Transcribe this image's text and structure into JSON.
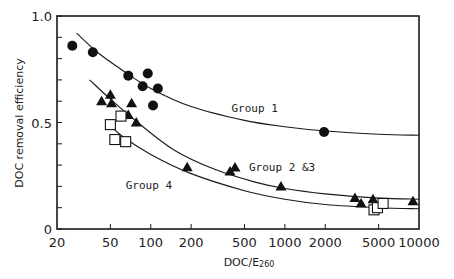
{
  "chart_data": {
    "type": "scatter",
    "title": "",
    "xlabel": "DOC/E",
    "xlabel_subscript": "260",
    "ylabel": "DOC removal efficiency",
    "xscale": "log",
    "xlim": [
      20,
      10000
    ],
    "ylim": [
      0,
      1.0
    ],
    "x_ticks": [
      20,
      50,
      100,
      200,
      500,
      1000,
      2000,
      5000,
      10000
    ],
    "x_tick_labels": [
      "20",
      "50",
      "100",
      "200",
      "500",
      "1000",
      "2000",
      "5000",
      "10000"
    ],
    "y_ticks": [
      0,
      0.5,
      1.0
    ],
    "y_tick_labels": [
      "0",
      "0.5",
      "1.0"
    ],
    "y_minor_step": 0.1,
    "grid": false,
    "legend": null,
    "series": [
      {
        "name": "Group 1",
        "marker": "filled-circle",
        "points": [
          [
            26,
            0.86
          ],
          [
            37,
            0.83
          ],
          [
            68,
            0.72
          ],
          [
            95,
            0.73
          ],
          [
            87,
            0.67
          ],
          [
            113,
            0.66
          ],
          [
            104,
            0.58
          ],
          [
            1960,
            0.455
          ]
        ]
      },
      {
        "name": "Group 2 &3",
        "marker": "filled-triangle",
        "points": [
          [
            43,
            0.6
          ],
          [
            50,
            0.63
          ],
          [
            51,
            0.59
          ],
          [
            72,
            0.59
          ],
          [
            68,
            0.535
          ],
          [
            78,
            0.5
          ],
          [
            187,
            0.29
          ],
          [
            390,
            0.27
          ],
          [
            935,
            0.2
          ],
          [
            3330,
            0.145
          ],
          [
            3700,
            0.12
          ],
          [
            4540,
            0.14
          ],
          [
            9020,
            0.13
          ]
        ]
      },
      {
        "name": "Group 4",
        "marker": "open-square",
        "points": [
          [
            50,
            0.49
          ],
          [
            60,
            0.53
          ],
          [
            54,
            0.42
          ],
          [
            65,
            0.41
          ],
          [
            4620,
            0.09
          ],
          [
            4900,
            0.1
          ],
          [
            5400,
            0.12
          ]
        ]
      }
    ],
    "fitted_curves": [
      {
        "name": "Group 1",
        "points": [
          [
            28,
            0.92
          ],
          [
            40,
            0.83
          ],
          [
            60,
            0.75
          ],
          [
            100,
            0.66
          ],
          [
            200,
            0.575
          ],
          [
            500,
            0.51
          ],
          [
            1000,
            0.48
          ],
          [
            2000,
            0.46
          ],
          [
            5000,
            0.445
          ],
          [
            10000,
            0.44
          ]
        ]
      },
      {
        "name": "Group 2 &3",
        "points": [
          [
            35,
            0.7
          ],
          [
            50,
            0.61
          ],
          [
            80,
            0.5
          ],
          [
            150,
            0.37
          ],
          [
            300,
            0.28
          ],
          [
            600,
            0.22
          ],
          [
            1000,
            0.19
          ],
          [
            2000,
            0.165
          ],
          [
            5000,
            0.145
          ],
          [
            10000,
            0.14
          ]
        ]
      },
      {
        "name": "Group 4",
        "points": [
          [
            48,
            0.5
          ],
          [
            60,
            0.44
          ],
          [
            100,
            0.35
          ],
          [
            200,
            0.26
          ],
          [
            500,
            0.18
          ],
          [
            1000,
            0.14
          ],
          [
            2000,
            0.115
          ],
          [
            5000,
            0.1
          ],
          [
            10000,
            0.095
          ]
        ]
      }
    ],
    "annotations": [
      {
        "text": "Group 1",
        "x": 400,
        "y": 0.55
      },
      {
        "text": "Group 2 &3",
        "x": 540,
        "y": 0.27,
        "marker": "filled-triangle"
      },
      {
        "text": "Group 4",
        "x": 65,
        "y": 0.19
      }
    ]
  },
  "axes": {
    "ylabel": "DOC removal efficiency",
    "xlabel_main": "DOC/E",
    "xlabel_sub": "260"
  }
}
